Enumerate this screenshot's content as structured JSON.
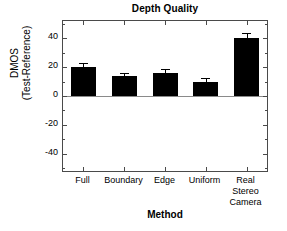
{
  "chart_data": {
    "type": "bar",
    "title": "Depth Quality",
    "xlabel": "Method",
    "ylabel_lines": [
      "DMOS",
      "(Test-Reference)"
    ],
    "categories": [
      "Full",
      "Boundary",
      "Edge",
      "Uniform",
      "Real Stereo Camera"
    ],
    "category_lines": [
      [
        "Full"
      ],
      [
        "Boundary"
      ],
      [
        "Edge"
      ],
      [
        "Uniform"
      ],
      [
        "Real",
        "Stereo",
        "Camera"
      ]
    ],
    "values": [
      20,
      14,
      16,
      10,
      40
    ],
    "errors": [
      3,
      2,
      3,
      2.5,
      4
    ],
    "ylim": [
      -52,
      52
    ],
    "yticks": [
      40,
      20,
      0,
      -20,
      -40
    ],
    "ytick_labels": [
      "40",
      "20",
      "0",
      "-20",
      "-40"
    ],
    "yminor_step": 10,
    "grid": false,
    "legend": null,
    "bar_color": "#000000",
    "axis_color": "#4a4a4a",
    "zero_line_color": "#8a8a8a"
  }
}
